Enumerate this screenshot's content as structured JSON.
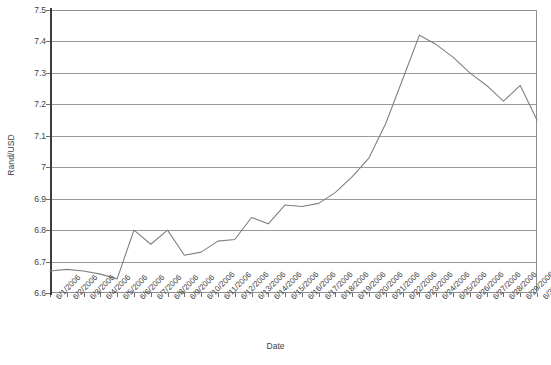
{
  "chart_data": {
    "type": "line",
    "title": "",
    "xlabel": "Date",
    "ylabel": "Rand/USD",
    "ylim": [
      6.6,
      7.5
    ],
    "ytick_labels": [
      "7.5",
      "7.4",
      "7.3",
      "7.2",
      "7.1",
      "7",
      "6.9",
      "6.8",
      "6.7",
      "6.6"
    ],
    "ytick_values": [
      7.5,
      7.4,
      7.3,
      7.2,
      7.1,
      7.0,
      6.9,
      6.8,
      6.7,
      6.6
    ],
    "grid": true,
    "legend": "none",
    "line_color": "#808080",
    "markers": false,
    "categories": [
      "6/1/2006",
      "6/2/2006",
      "6/3/2006",
      "6/4/2006",
      "6/5/2006",
      "6/6/2006",
      "6/7/2006",
      "6/8/2006",
      "6/9/2006",
      "6/10/2006",
      "6/11/2006",
      "6/12/2006",
      "6/13/2006",
      "6/14/2006",
      "6/15/2006",
      "6/16/2006",
      "6/17/2006",
      "6/18/2006",
      "6/19/2006",
      "6/20/2006",
      "6/21/2006",
      "6/22/2006",
      "6/23/2006",
      "6/24/2006",
      "6/25/2006",
      "6/26/2006",
      "6/27/2006",
      "6/28/2006",
      "6/29/2006",
      "6/30/2006"
    ],
    "series": [
      {
        "name": "Rand/USD",
        "values": [
          6.67,
          6.675,
          6.67,
          6.66,
          6.645,
          6.8,
          6.755,
          6.8,
          6.72,
          6.73,
          6.765,
          6.77,
          6.84,
          6.82,
          6.88,
          6.875,
          6.885,
          6.92,
          6.97,
          7.03,
          7.14,
          7.28,
          7.42,
          7.39,
          7.35,
          7.3,
          7.26,
          7.21,
          7.26,
          7.15
        ]
      }
    ]
  }
}
